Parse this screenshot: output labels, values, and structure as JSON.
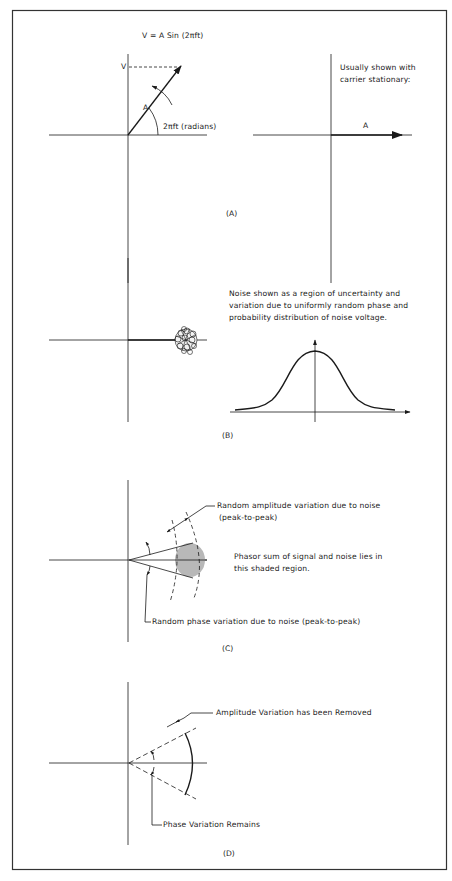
{
  "panels": {
    "a": {
      "caption": "(A)",
      "equation": "V = A Sin (2πft)",
      "v_label": "V",
      "a_label": "A",
      "angle_label": "2πft (radians)",
      "note_line1": "Usually shown with",
      "note_line2": "carrier stationary:",
      "stationary_a_label": "A"
    },
    "b": {
      "caption": "(B)",
      "note_line1": "Noise shown as a region of uncertainty and",
      "note_line2": "variation due to uniformly random phase and",
      "note_line3": "probability distribution of noise voltage."
    },
    "c": {
      "caption": "(C)",
      "amplitude_line1": "Random amplitude variation due to noise",
      "amplitude_line2": "(peak-to-peak)",
      "sum_line1": "Phasor sum of signal and noise lies in",
      "sum_line2": "this shaded region.",
      "phase_label": "Random phase variation due to noise (peak-to-peak)"
    },
    "d": {
      "caption": "(D)",
      "amplitude_label": "Amplitude Variation has been Removed",
      "phase_label": "Phase Variation Remains"
    }
  },
  "colors": {
    "line": "#1a1a1a",
    "shade": "#b8b8b8",
    "border": "#333333"
  }
}
